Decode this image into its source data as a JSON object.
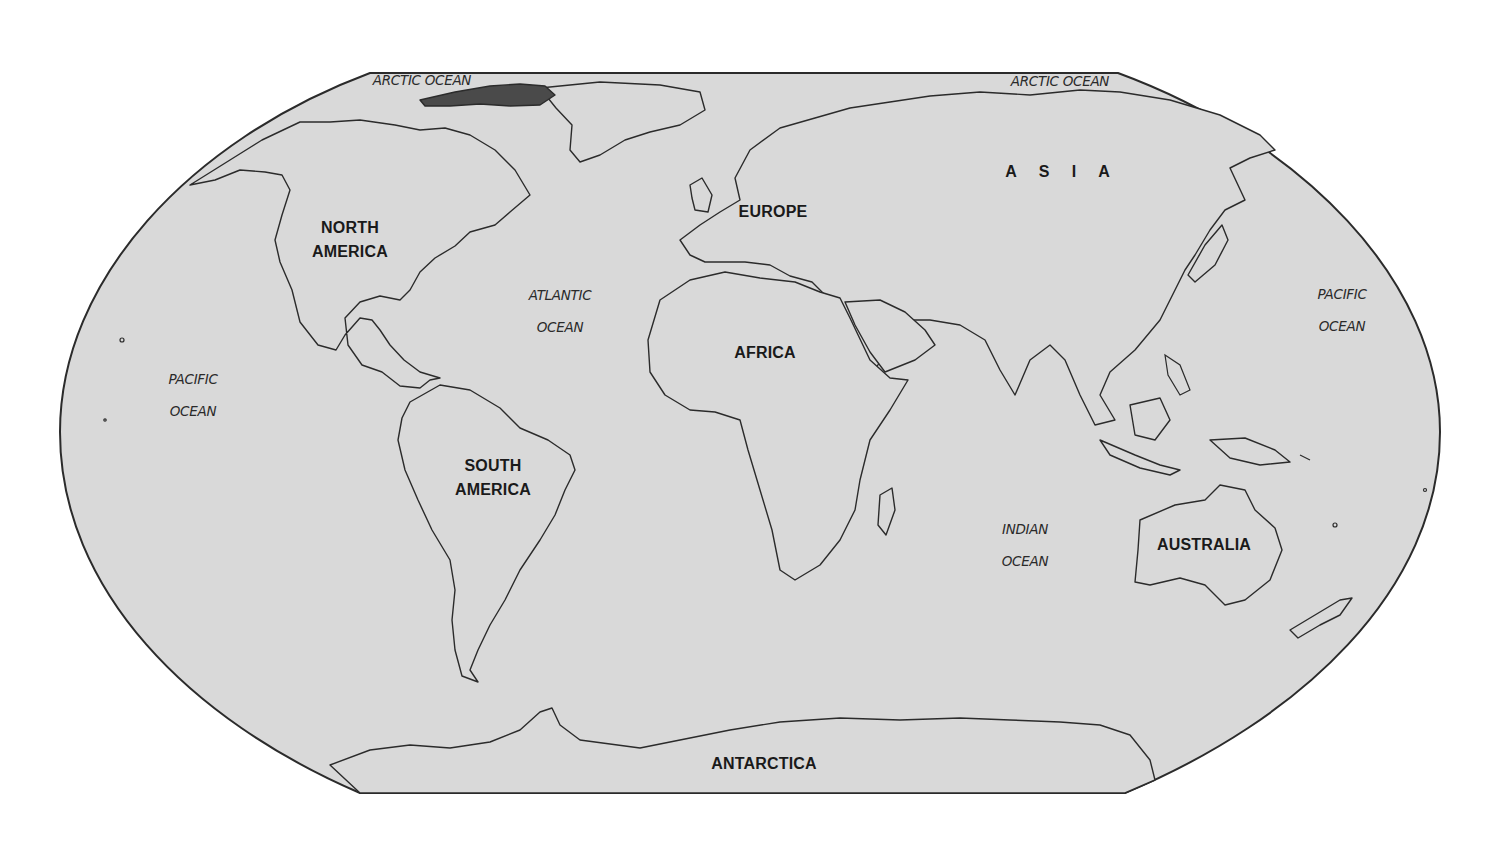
{
  "map": {
    "projection": "Robinson-style world outline",
    "colors": {
      "ocean_fill": "#d9d9d9",
      "outline": "#2b2b2b",
      "land_fill": "#d9d9d9",
      "ice_fill": "#4a4a4a",
      "background": "#ffffff"
    },
    "continents": [
      {
        "id": "north-america",
        "label": "NORTH AMERICA",
        "line1": "NORTH",
        "line2": "AMERICA",
        "x": 350,
        "y": 240
      },
      {
        "id": "south-america",
        "label": "SOUTH AMERICA",
        "line1": "SOUTH",
        "line2": "AMERICA",
        "x": 493,
        "y": 478
      },
      {
        "id": "europe",
        "label": "EUROPE",
        "x": 773,
        "y": 212
      },
      {
        "id": "africa",
        "label": "AFRICA",
        "x": 765,
        "y": 353
      },
      {
        "id": "asia",
        "label": "A S I A",
        "x": 1060,
        "y": 172
      },
      {
        "id": "australia",
        "label": "AUSTRALIA",
        "x": 1204,
        "y": 545
      },
      {
        "id": "antarctica",
        "label": "ANTARCTICA",
        "x": 764,
        "y": 764
      }
    ],
    "oceans": [
      {
        "id": "arctic-ocean-west",
        "label": "ARCTIC OCEAN",
        "line1": "ARCTIC OCEAN",
        "x": 422,
        "y": 80
      },
      {
        "id": "arctic-ocean-east",
        "label": "ARCTIC OCEAN",
        "line1": "ARCTIC OCEAN",
        "x": 1060,
        "y": 81
      },
      {
        "id": "pacific-ocean-west",
        "label": "PACIFIC OCEAN",
        "line1": "PACIFIC",
        "line2": "OCEAN",
        "x": 193,
        "y": 395
      },
      {
        "id": "pacific-ocean-east",
        "label": "PACIFIC OCEAN",
        "line1": "PACIFIC",
        "line2": "OCEAN",
        "x": 1342,
        "y": 310
      },
      {
        "id": "atlantic-ocean",
        "label": "ATLANTIC OCEAN",
        "line1": "ATLANTIC",
        "line2": "OCEAN",
        "x": 560,
        "y": 311
      },
      {
        "id": "indian-ocean",
        "label": "INDIAN OCEAN",
        "line1": "INDIAN",
        "line2": "OCEAN",
        "x": 1025,
        "y": 545
      }
    ]
  }
}
